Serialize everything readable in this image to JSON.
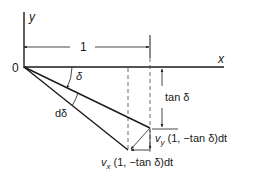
{
  "labels": {
    "y_axis": "y",
    "x_axis": "x",
    "origin": "0",
    "unit_length": "1",
    "angle_delta": "δ",
    "angle_d_delta": "dδ",
    "tan_delta": "tan δ",
    "vy_var": "v",
    "vy_sub": "y",
    "vy_expr": " (1, −tan δ)dt",
    "vx_var": "v",
    "vx_sub": "x",
    "vx_expr": " (1, −tan δ)dt"
  },
  "colors": {
    "line": "#1a1a1a",
    "dashed": "#444444",
    "background": "#ffffff"
  }
}
